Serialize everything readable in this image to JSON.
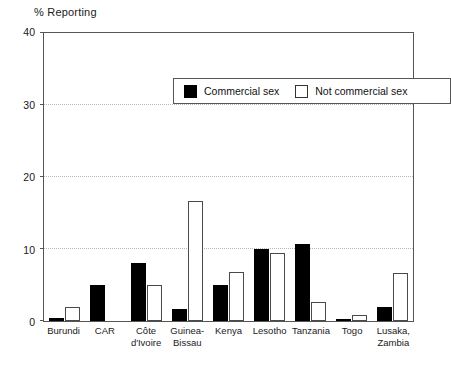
{
  "chart_data": {
    "type": "bar",
    "title": "% Reporting",
    "xlabel": "",
    "ylabel": "% Reporting",
    "ylim": [
      0,
      40
    ],
    "yticks": [
      0,
      10,
      20,
      30,
      40
    ],
    "grid": true,
    "legend_position": "top-center",
    "categories": [
      "Burundi",
      "CAR",
      "Côte\nd'Ivoire",
      "Guinea-\nBissau",
      "Kenya",
      "Lesotho",
      "Tanzania",
      "Togo",
      "Lusaka,\nZambia"
    ],
    "series": [
      {
        "name": "Commercial sex",
        "color": "#000000",
        "values": [
          0.4,
          5.0,
          8.0,
          1.7,
          5.0,
          10.0,
          10.7,
          0.3,
          2.0
        ]
      },
      {
        "name": "Not commercial sex",
        "color": "#ffffff",
        "values": [
          2.0,
          0,
          5.0,
          16.7,
          6.8,
          9.5,
          2.7,
          0.8,
          6.6
        ]
      }
    ]
  },
  "legend": {
    "items": [
      {
        "label": "Commercial sex",
        "swatch": "filled"
      },
      {
        "label": "Not commercial sex",
        "swatch": "hollow"
      }
    ]
  },
  "colors": {
    "commercial": "#000000",
    "not_commercial": "#ffffff",
    "axis": "#555555",
    "grid": "#b8b8b8"
  }
}
